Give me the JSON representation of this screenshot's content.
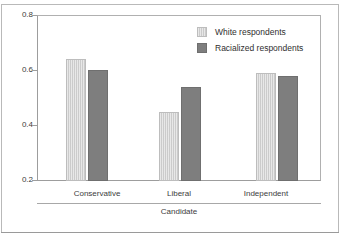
{
  "chart_data": {
    "type": "bar",
    "title": "",
    "subtitle": "",
    "xlabel": "Candidate",
    "ylabel": "",
    "categories": [
      "Conservative",
      "Liberal",
      "Independent"
    ],
    "series": [
      {
        "name": "White respondents",
        "values": [
          0.64,
          0.45,
          0.59
        ],
        "color": "#cbcbcb"
      },
      {
        "name": "Racialized respondents",
        "values": [
          0.6,
          0.54,
          0.58
        ],
        "color": "#7e7e7e"
      }
    ],
    "ylim": [
      0.2,
      0.8
    ],
    "yticks": [
      "0.2",
      "0.4",
      "0.6",
      "0.8"
    ],
    "ytick_values": [
      0.2,
      0.4,
      0.6,
      0.8
    ],
    "grid": false,
    "legend_position": "top-right",
    "annotations": []
  },
  "legend": {
    "items": [
      {
        "label": "White respondents",
        "swatch": "light-gray-swatch"
      },
      {
        "label": "Racialized respondents",
        "swatch": "dark-gray-swatch"
      }
    ]
  },
  "axes": {
    "y_ticks": [
      "0.8",
      "0.6",
      "0.4",
      "0.2"
    ],
    "x_categories": [
      "Conservative",
      "Liberal",
      "Independent"
    ],
    "x_group_label": "Candidate"
  }
}
